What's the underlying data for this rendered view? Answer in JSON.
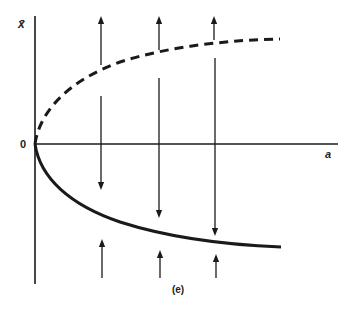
{
  "diagram": {
    "y_axis_label": "x̄",
    "x_axis_label": "a",
    "origin_label": "0",
    "caption": "(e)",
    "curves": [
      {
        "name": "upper-branch",
        "style": "dashed",
        "stability": "unstable"
      },
      {
        "name": "lower-branch",
        "style": "solid",
        "stability": "stable"
      }
    ],
    "flow_arrows": {
      "x_positions": [
        101,
        159,
        215
      ],
      "upward_top": 3,
      "downward_middle": 3,
      "upward_bottom": 3
    },
    "colors": {
      "ink": "#1a1a1a",
      "background": "#ffffff"
    }
  }
}
